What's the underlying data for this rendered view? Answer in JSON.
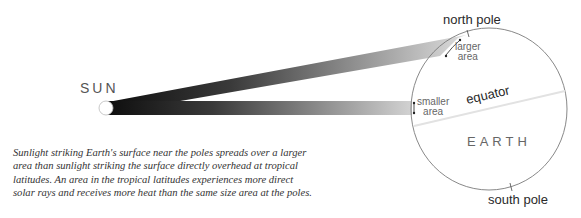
{
  "diagram": {
    "sun_label": "SUN",
    "earth_label": "EARTH",
    "north_pole_label": "north pole",
    "south_pole_label": "south pole",
    "equator_label": "equator",
    "larger_area_line1": "larger",
    "larger_area_line2": "area",
    "smaller_area_line1": "smaller",
    "smaller_area_line2": "area",
    "caption": "Sunlight striking Earth's surface near the poles spreads over a larger area than sunlight striking the surface directly overhead at tropical latitudes. An area in the tropical latitudes experiences more direct solar rays and receives more heat than the same size area at the poles.",
    "colors": {
      "beam_dark": "#111111",
      "beam_light": "#d8d8d8",
      "earth_outline": "#777777",
      "equator_line": "#e6e6e6"
    }
  }
}
